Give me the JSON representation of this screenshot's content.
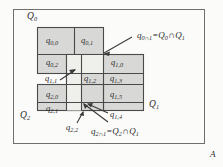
{
  "figure": {
    "label": "A",
    "frame_color": "#6b6b6b",
    "band_fill": "#d6d6d6",
    "overlap_fill": "#ededea",
    "stroke_color": "#4a4a4a",
    "background": "#fbfbfa"
  },
  "sets": {
    "q0": "Q",
    "q0_sub": "0",
    "q1": "Q",
    "q1_sub": "1",
    "q2": "Q",
    "q2_sub": "2"
  },
  "cells": [
    {
      "base": "q",
      "sub": "0,0",
      "x": 46,
      "y": 41
    },
    {
      "base": "q",
      "sub": "0,1",
      "x": 82,
      "y": 41
    },
    {
      "base": "q",
      "sub": "0,2",
      "x": 46,
      "y": 62
    },
    {
      "base": "q",
      "sub": "1,0",
      "x": 113,
      "y": 62
    },
    {
      "base": "q",
      "sub": "1,1",
      "x": 47,
      "y": 77
    },
    {
      "base": "q",
      "sub": "1,2",
      "x": 89,
      "y": 77
    },
    {
      "base": "q",
      "sub": "1,3",
      "x": 113,
      "y": 77
    },
    {
      "base": "q",
      "sub": "2,0",
      "x": 46,
      "y": 94
    },
    {
      "base": "q",
      "sub": "1,5",
      "x": 113,
      "y": 94
    },
    {
      "base": "q",
      "sub": "2,1",
      "x": 46,
      "y": 108
    },
    {
      "base": "q",
      "sub": "2,2",
      "x": 72,
      "y": 126
    },
    {
      "base": "q",
      "sub": "1,4",
      "x": 113,
      "y": 114
    }
  ],
  "annotations": {
    "top": {
      "left_base": "q",
      "left_sub": "0∩1",
      "equals": "=",
      "right_a": "Q",
      "right_a_sub": "0",
      "cap": "∩",
      "right_b": "Q",
      "right_b_sub": "1"
    },
    "bottom": {
      "left_base": "q",
      "left_sub": "2∩1",
      "equals": "=",
      "right_a": "Q",
      "right_a_sub": "2",
      "cap": "∩",
      "right_b": "Q",
      "right_b_sub": "1"
    }
  },
  "set_labels": {
    "q0_x": 28,
    "q0_y": 16,
    "q1_x": 150,
    "q1_y": 104,
    "q2_x": 21,
    "q2_y": 115
  }
}
